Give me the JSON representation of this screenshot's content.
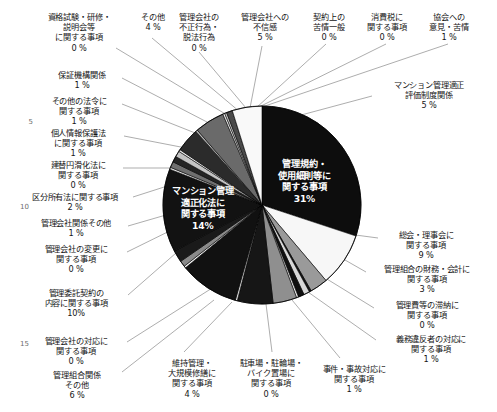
{
  "chart_data": {
    "type": "pie",
    "title": "",
    "legend_position": "callout-labels",
    "grid": false,
    "center": [
      262,
      205
    ],
    "radius": 99,
    "start_angle_deg": -90,
    "direction": "clockwise",
    "categories": [
      "管理規約・\n使用細則等に\n関する事項",
      "総会・理事会に\n関する事項",
      "管理組合の財務・会計に\n関する事項",
      "管理費等の滞納に\n関する事項",
      "義務違反者の対応に\n関する事項",
      "事件・事故対応に\n関する事項",
      "駐車場・駐輪場・\nバイク置場に\n関する事項",
      "維持管理・\n大規模修繕に\n関する事項",
      "管理組合関係\nその他",
      "管理会社の対応に\n関する事項",
      "管理委託契約の\n内容に関する事項",
      "管理会社の変更に\n関する事項",
      "管理会社関係その他",
      "区分所有法に関する事項",
      "マンション管理\n適正化法に\n関する事項",
      "建替円滑化法に\n関する事項",
      "個人情報保護法\nに関する事項",
      "その他の法令に\n関する事項",
      "保証機構関係",
      "資格試験・研修・\n説明会等\nに関する事項",
      "その他",
      "管理会社の\n不正行為・\n脱法行為",
      "管理会社への\n不信感",
      "契約上の\n苦情一般",
      "消費税に\n関する事項",
      "協会への\n意見・苦情",
      "マンション管理適正\n評価制度関係"
    ],
    "values": [
      31,
      9,
      3,
      0,
      1,
      1,
      0,
      4,
      6,
      0,
      10,
      0,
      1,
      2,
      14,
      0,
      1,
      1,
      1,
      0,
      4,
      0,
      5,
      0,
      0,
      1,
      5
    ],
    "value_labels": [
      "31%",
      "9 %",
      "3 %",
      "0 %",
      "1 %",
      "1 %",
      "0 %",
      "4 %",
      "6 %",
      "0 %",
      "10%",
      "0 %",
      "1 %",
      "2 %",
      "14%",
      "0 %",
      "1 %",
      "1 %",
      "1 %",
      "0 %",
      "4 %",
      "0 %",
      "5 %",
      "0 %",
      "0 %",
      "1 %",
      "5 %"
    ],
    "slice_colors": [
      "#0d0d0d",
      "#f7f7f7",
      "#9a9a9a",
      "#141414",
      "#d8d8d8",
      "#101010",
      "#f2f2f2",
      "#8f8f8f",
      "#161616",
      "#e2e2e2",
      "#111111",
      "#f4f4f4",
      "#8a8a8a",
      "#1a1a1a",
      "#121212",
      "#e8e8e8",
      "#6f6f6f",
      "#242424",
      "#c4c4c4",
      "#f0f0f0",
      "#2b2b2b",
      "#b7b7b7",
      "#6a6a6a",
      "#ededed",
      "#c9c9c9",
      "#4a4a4a",
      "#f9f9f9"
    ],
    "xlabel": "",
    "ylabel": ""
  },
  "inner_labels": [
    {
      "text": "管理規約・\n使用細則等に\n関する事項\n31%",
      "x": 278,
      "y": 158
    },
    {
      "text": "マンション管理\n適正化法に\n関する事項\n14%",
      "x": 172,
      "y": 185
    }
  ],
  "callouts": [
    {
      "id": "qualification-exam",
      "text": "資格試験・研修・\n説明会等\nに関する事項\n0 %",
      "x": 36,
      "y": 12,
      "w": 86,
      "align": "center"
    },
    {
      "id": "other-top",
      "text": "その他\n4 %",
      "x": 128,
      "y": 12,
      "w": 50,
      "align": "center"
    },
    {
      "id": "mgmt-co-illegal",
      "text": "管理会社の\n不正行為・\n脱法行為\n0 %",
      "x": 168,
      "y": 12,
      "w": 62,
      "align": "center"
    },
    {
      "id": "mgmt-co-distrust",
      "text": "管理会社への\n不信感\n5 %",
      "x": 231,
      "y": 12,
      "w": 68,
      "align": "center"
    },
    {
      "id": "contract-complaints",
      "text": "契約上の\n苦情一般\n0 %",
      "x": 303,
      "y": 12,
      "w": 52,
      "align": "center"
    },
    {
      "id": "consumption-tax",
      "text": "消費税に\n関する事項\n0 %",
      "x": 359,
      "y": 12,
      "w": 56,
      "align": "center"
    },
    {
      "id": "association-opinions",
      "text": "協会への\n意見・苦情\n1 %",
      "x": 421,
      "y": 12,
      "w": 56,
      "align": "center"
    },
    {
      "id": "guarantee-org",
      "text": "保証機構関係\n1 %",
      "x": 42,
      "y": 70,
      "w": 80,
      "align": "center"
    },
    {
      "id": "other-laws",
      "text": "その他の法令に\n関する事項\n1 %",
      "x": 36,
      "y": 96,
      "w": 86,
      "align": "center"
    },
    {
      "id": "personal-info-law",
      "text": "個人情報保護法\nに関する事項\n1 %",
      "x": 33,
      "y": 128,
      "w": 90,
      "align": "center"
    },
    {
      "id": "rebuilding-law",
      "text": "建替円滑化法に\n関する事項\n0 %",
      "x": 34,
      "y": 160,
      "w": 88,
      "align": "center"
    },
    {
      "id": "condo-ownership-law",
      "text": "区分所有法に関する事項\n2 %",
      "x": 18,
      "y": 192,
      "w": 114,
      "align": "center"
    },
    {
      "id": "mgmt-co-other",
      "text": "管理会社関係その他\n1 %",
      "x": 25,
      "y": 218,
      "w": 102,
      "align": "center"
    },
    {
      "id": "mgmt-co-change",
      "text": "管理会社の変更に\n関する事項\n0 %",
      "x": 28,
      "y": 244,
      "w": 96,
      "align": "center"
    },
    {
      "id": "mgmt-contract-content",
      "text": "管理委託契約の\n内容に関する事項\n10%",
      "x": 26,
      "y": 288,
      "w": 100,
      "align": "center"
    },
    {
      "id": "mgmt-co-response",
      "text": "管理会社の対応に\n関する事項\n0 %",
      "x": 28,
      "y": 336,
      "w": 96,
      "align": "center"
    },
    {
      "id": "mgmt-assoc-other",
      "text": "管理組合関係\nその他\n6 %",
      "x": 38,
      "y": 370,
      "w": 78,
      "align": "center"
    },
    {
      "id": "maintenance-repair",
      "text": "維持管理・\n大規模修繕に\n関する事項\n4 %",
      "x": 151,
      "y": 358,
      "w": 82,
      "align": "center"
    },
    {
      "id": "parking-bicycle",
      "text": "駐車場・駐輪場・\nバイク置場に\n関する事項\n0 %",
      "x": 228,
      "y": 358,
      "w": 86,
      "align": "center"
    },
    {
      "id": "incident-accident",
      "text": "事件・事故対応に\n関する事項\n1 %",
      "x": 310,
      "y": 364,
      "w": 88,
      "align": "center"
    },
    {
      "id": "violator-response",
      "text": "義務違反者の対応に\n関する事項\n1 %",
      "x": 381,
      "y": 334,
      "w": 100,
      "align": "center"
    },
    {
      "id": "mgmt-fee-arrears",
      "text": "管理費等の滞納に\n関する事項\n0 %",
      "x": 379,
      "y": 300,
      "w": 96,
      "align": "center"
    },
    {
      "id": "assoc-finance",
      "text": "管理組合の財務・会計に\n関する事項\n3 %",
      "x": 370,
      "y": 264,
      "w": 114,
      "align": "center"
    },
    {
      "id": "general-board",
      "text": "総会・理事会に\n関する事項\n9 %",
      "x": 383,
      "y": 230,
      "w": 86,
      "align": "center"
    },
    {
      "id": "evaluation-system",
      "text": "マンション管理適正\n評価制度関係\n5 %",
      "x": 377,
      "y": 80,
      "w": 104,
      "align": "center"
    }
  ],
  "line_numbers": [
    {
      "label": "5",
      "x": 17,
      "y": 118
    },
    {
      "label": "10",
      "x": 13,
      "y": 203
    },
    {
      "label": "15",
      "x": 13,
      "y": 340
    }
  ],
  "leader_lines": [
    {
      "id": "leader-qualification-exam",
      "x1": 116,
      "y1": 48,
      "x2": 232,
      "y2": 118
    },
    {
      "id": "leader-other-top",
      "x1": 152,
      "y1": 38,
      "x2": 240,
      "y2": 112
    },
    {
      "id": "leader-mgmt-co-illegal",
      "x1": 199,
      "y1": 52,
      "x2": 246,
      "y2": 108
    },
    {
      "id": "leader-mgmt-co-distrust",
      "x1": 262,
      "y1": 46,
      "x2": 250,
      "y2": 108
    },
    {
      "id": "leader-contract-complaints",
      "x1": 326,
      "y1": 44,
      "x2": 256,
      "y2": 108
    },
    {
      "id": "leader-consumption-tax",
      "x1": 386,
      "y1": 44,
      "x2": 259,
      "y2": 107
    },
    {
      "id": "leader-association",
      "x1": 448,
      "y1": 44,
      "x2": 262,
      "y2": 107
    },
    {
      "id": "leader-evaluation-system",
      "x1": 372,
      "y1": 96,
      "x2": 290,
      "y2": 118
    },
    {
      "id": "leader-guarantee-org",
      "x1": 122,
      "y1": 78,
      "x2": 234,
      "y2": 136
    },
    {
      "id": "leader-other-laws",
      "x1": 122,
      "y1": 104,
      "x2": 228,
      "y2": 146
    },
    {
      "id": "leader-personal-info",
      "x1": 124,
      "y1": 136,
      "x2": 222,
      "y2": 155
    },
    {
      "id": "leader-rebuilding-law",
      "x1": 123,
      "y1": 168,
      "x2": 205,
      "y2": 168
    },
    {
      "id": "leader-condo-law",
      "x1": 133,
      "y1": 197,
      "x2": 186,
      "y2": 180
    },
    {
      "id": "leader-mgmt-co-other",
      "x1": 128,
      "y1": 226,
      "x2": 190,
      "y2": 208
    },
    {
      "id": "leader-mgmt-co-change",
      "x1": 127,
      "y1": 252,
      "x2": 196,
      "y2": 218
    },
    {
      "id": "leader-mgmt-contract",
      "x1": 128,
      "y1": 295,
      "x2": 200,
      "y2": 232
    },
    {
      "id": "leader-mgmt-co-response",
      "x1": 127,
      "y1": 342,
      "x2": 228,
      "y2": 278
    },
    {
      "id": "leader-mgmt-assoc-other",
      "x1": 122,
      "y1": 372,
      "x2": 214,
      "y2": 300
    },
    {
      "id": "leader-maintenance",
      "x1": 184,
      "y1": 352,
      "x2": 232,
      "y2": 302
    },
    {
      "id": "leader-parking",
      "x1": 272,
      "y1": 352,
      "x2": 266,
      "y2": 304
    },
    {
      "id": "leader-incident",
      "x1": 340,
      "y1": 358,
      "x2": 292,
      "y2": 300
    },
    {
      "id": "leader-violator",
      "x1": 376,
      "y1": 340,
      "x2": 308,
      "y2": 292
    },
    {
      "id": "leader-arrears",
      "x1": 374,
      "y1": 308,
      "x2": 322,
      "y2": 276
    },
    {
      "id": "leader-finance",
      "x1": 366,
      "y1": 272,
      "x2": 338,
      "y2": 256
    },
    {
      "id": "leader-general-board",
      "x1": 378,
      "y1": 238,
      "x2": 348,
      "y2": 234
    }
  ]
}
